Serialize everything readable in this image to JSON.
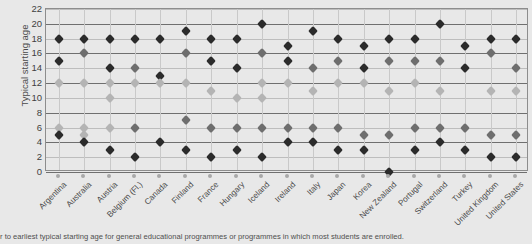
{
  "chart_data": {
    "type": "scatter",
    "title": "",
    "xlabel": "",
    "ylabel": "Typical starting age",
    "ylim": [
      0,
      22
    ],
    "ytick_step": 2,
    "yticks": [
      0,
      2,
      4,
      6,
      8,
      10,
      12,
      14,
      16,
      18,
      20,
      22
    ],
    "grid": true,
    "legend_position": "none",
    "categories": [
      "Argentina",
      "Australia",
      "Austria",
      "Belgium (Fl.)",
      "Canada",
      "Finland",
      "France",
      "Hungary",
      "Iceland",
      "Ireland",
      "Italy",
      "Japan",
      "Korea",
      "New Zealand",
      "Portugal",
      "Switzerland",
      "Turkey",
      "United Kingdom",
      "United States"
    ],
    "points": [
      {
        "category": "Argentina",
        "values": [
          18,
          15,
          12,
          6,
          5
        ],
        "shades": [
          "dark",
          "dark",
          "light",
          "light",
          "dark"
        ]
      },
      {
        "category": "Australia",
        "values": [
          18,
          16,
          12,
          6,
          5,
          4
        ],
        "shades": [
          "dark",
          "mid",
          "light",
          "light",
          "light",
          "dark"
        ]
      },
      {
        "category": "Austria",
        "values": [
          18,
          14,
          12,
          10,
          6,
          3
        ],
        "shades": [
          "dark",
          "dark",
          "light",
          "light",
          "light",
          "dark"
        ]
      },
      {
        "category": "Belgium (Fl.)",
        "values": [
          18,
          14,
          12,
          6,
          2
        ],
        "shades": [
          "dark",
          "mid",
          "light",
          "mid",
          "dark"
        ]
      },
      {
        "category": "Canada",
        "values": [
          18,
          13,
          12,
          4
        ],
        "shades": [
          "dark",
          "dark",
          "light",
          "dark"
        ]
      },
      {
        "category": "Finland",
        "values": [
          19,
          16,
          12,
          7,
          3
        ],
        "shades": [
          "dark",
          "mid",
          "light",
          "mid",
          "dark"
        ]
      },
      {
        "category": "France",
        "values": [
          18,
          15,
          11,
          6,
          2
        ],
        "shades": [
          "dark",
          "dark",
          "light",
          "mid",
          "dark"
        ]
      },
      {
        "category": "Hungary",
        "values": [
          18,
          14,
          10,
          6,
          3
        ],
        "shades": [
          "dark",
          "dark",
          "light",
          "mid",
          "dark"
        ]
      },
      {
        "category": "Iceland",
        "values": [
          20,
          16,
          12,
          10,
          6,
          2
        ],
        "shades": [
          "dark",
          "mid",
          "light",
          "light",
          "mid",
          "dark"
        ]
      },
      {
        "category": "Ireland",
        "values": [
          17,
          15,
          12,
          6,
          4
        ],
        "shades": [
          "dark",
          "dark",
          "light",
          "mid",
          "dark"
        ]
      },
      {
        "category": "Italy",
        "values": [
          19,
          14,
          11,
          6,
          4
        ],
        "shades": [
          "dark",
          "mid",
          "light",
          "mid",
          "dark"
        ]
      },
      {
        "category": "Japan",
        "values": [
          18,
          15,
          12,
          6,
          3
        ],
        "shades": [
          "dark",
          "mid",
          "light",
          "mid",
          "dark"
        ]
      },
      {
        "category": "Korea",
        "values": [
          17,
          14,
          12,
          5,
          3
        ],
        "shades": [
          "dark",
          "dark",
          "light",
          "mid",
          "dark"
        ]
      },
      {
        "category": "New Zealand",
        "values": [
          18,
          15,
          11,
          5,
          0
        ],
        "shades": [
          "dark",
          "mid",
          "light",
          "mid",
          "dark"
        ]
      },
      {
        "category": "Portugal",
        "values": [
          18,
          15,
          12,
          6,
          3
        ],
        "shades": [
          "dark",
          "mid",
          "light",
          "mid",
          "dark"
        ]
      },
      {
        "category": "Switzerland",
        "values": [
          20,
          15,
          11,
          6,
          4
        ],
        "shades": [
          "dark",
          "mid",
          "light",
          "mid",
          "dark"
        ]
      },
      {
        "category": "Turkey",
        "values": [
          17,
          14,
          6,
          3
        ],
        "shades": [
          "dark",
          "dark",
          "mid",
          "dark"
        ]
      },
      {
        "category": "United Kingdom",
        "values": [
          18,
          16,
          11,
          5,
          2
        ],
        "shades": [
          "dark",
          "mid",
          "light",
          "mid",
          "dark"
        ]
      },
      {
        "category": "United States",
        "values": [
          18,
          14,
          11,
          5,
          2
        ],
        "shades": [
          "dark",
          "mid",
          "light",
          "mid",
          "dark"
        ]
      }
    ]
  },
  "footnote": {
    "text": "r to earliest typical starting age for general educational programmes or programmes in which most students are enrolled."
  },
  "colors": {
    "background": "#e8e8e8",
    "marker_dark": "#2b2b2b",
    "marker_mid": "#6e6e6e",
    "marker_light": "#b4b4b4",
    "gridline": "#6f6f6f",
    "axis": "#8d8d8d"
  }
}
